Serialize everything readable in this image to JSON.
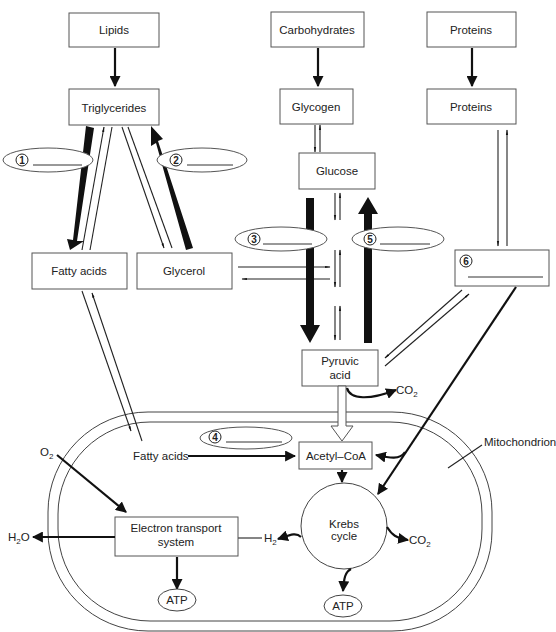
{
  "diagram": {
    "title_cutoff": "",
    "sources": {
      "lipids": "Lipids",
      "carbohydrates": "Carbohydrates",
      "proteins_top": "Proteins"
    },
    "storage": {
      "triglycerides": "Triglycerides",
      "glycogen": "Glycogen",
      "proteins": "Proteins"
    },
    "intermediates": {
      "glucose": "Glucose",
      "fatty_acids": "Fatty acids",
      "glycerol": "Glycerol",
      "pyruvic_acid_line1": "Pyruvic",
      "pyruvic_acid_line2": "acid"
    },
    "blanks": [
      {
        "number": "1",
        "answer": ""
      },
      {
        "number": "2",
        "answer": ""
      },
      {
        "number": "3",
        "answer": ""
      },
      {
        "number": "4",
        "answer": ""
      },
      {
        "number": "5",
        "answer": ""
      },
      {
        "number": "6",
        "answer": ""
      }
    ],
    "mitochondrion": {
      "label": "Mitochondrion",
      "fatty_acids": "Fatty acids",
      "acetyl_coa": "Acetyl–CoA",
      "krebs_line1": "Krebs",
      "krebs_line2": "cycle",
      "ets_line1": "Electron transport",
      "ets_line2": "system",
      "atp_ets": "ATP",
      "atp_krebs": "ATP"
    },
    "molecules": {
      "co2_pyruvate": {
        "base": "CO",
        "sub": "2"
      },
      "co2_krebs": {
        "base": "CO",
        "sub": "2"
      },
      "o2": {
        "base": "O",
        "sub": "2"
      },
      "h2o": {
        "base": "H",
        "sub": "2",
        "tail": "O"
      },
      "h2": {
        "base": "H",
        "sub": "2"
      }
    }
  }
}
